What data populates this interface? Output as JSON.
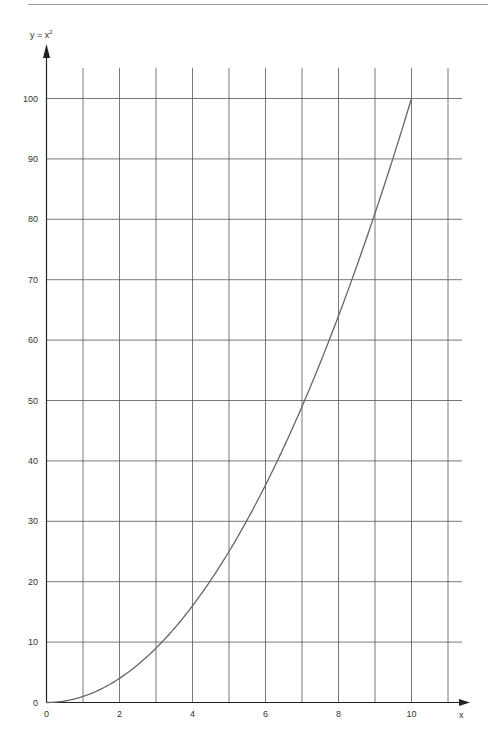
{
  "chart_data": {
    "type": "line",
    "title": "",
    "ylabel": "y = x²",
    "ylabel_base": "y = x",
    "ylabel_sup": "2",
    "xlabel": "x",
    "xlim": [
      0,
      11
    ],
    "ylim": [
      0,
      100
    ],
    "x_ticks": [
      0,
      2,
      4,
      6,
      8,
      10
    ],
    "x_tick_labels": [
      "0",
      "2",
      "4",
      "6",
      "8",
      "10"
    ],
    "y_ticks": [
      0,
      10,
      20,
      30,
      40,
      50,
      60,
      70,
      80,
      90,
      100
    ],
    "y_tick_labels": [
      "0",
      "10",
      "20",
      "30",
      "40",
      "50",
      "60",
      "70",
      "80",
      "90",
      "100"
    ],
    "grid": true,
    "x_grid_step": 1,
    "y_grid_step": 10,
    "series": [
      {
        "name": "y = x^2",
        "x": [
          0,
          1,
          2,
          3,
          4,
          5,
          6,
          7,
          8,
          9,
          10
        ],
        "values": [
          0,
          1,
          4,
          9,
          16,
          25,
          36,
          49,
          64,
          81,
          100
        ]
      }
    ]
  },
  "colors": {
    "grid": "#555555",
    "axis": "#222222",
    "curve": "#666666",
    "text": "#333333"
  }
}
